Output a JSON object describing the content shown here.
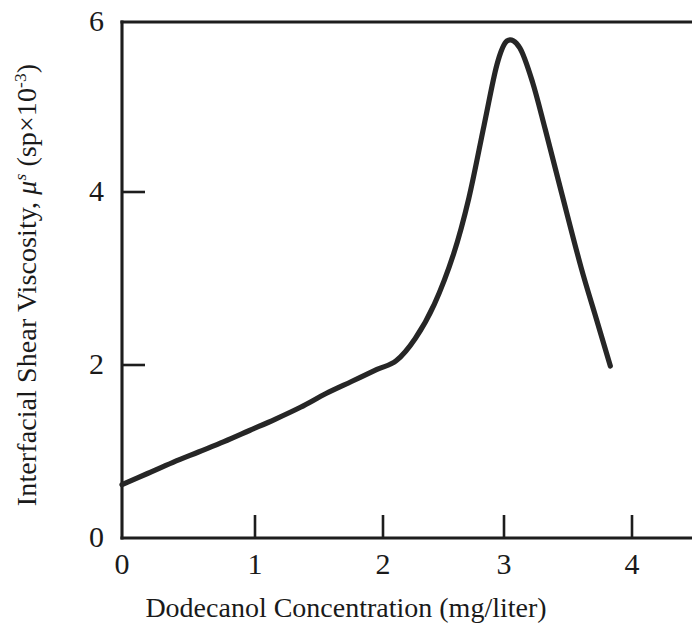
{
  "chart_data": {
    "type": "line",
    "title": "",
    "subtitle": "",
    "xlabel": "Dodecanol Concentration (mg/liter)",
    "ylabel_parts": {
      "prefix": "Interfacial Shear Viscosity, ",
      "symbol": "μ",
      "symbol_sup": "s",
      "unit_open": " (sp×10",
      "unit_exp": "-3",
      "unit_close": ")"
    },
    "ylabel_text": "Interfacial Shear Viscosity, μˢ (sp×10⁻³)",
    "xlim": [
      0,
      4.45
    ],
    "ylim": [
      0,
      6
    ],
    "xticks": [
      0,
      1,
      2,
      3,
      4
    ],
    "xtick_labels": [
      "0",
      "1",
      "2",
      "3",
      "4"
    ],
    "yticks": [
      0,
      2,
      4,
      6
    ],
    "ytick_labels": [
      "0",
      "2",
      "4",
      "6"
    ],
    "grid": false,
    "legend": null,
    "frame": "left-top-bottom",
    "line_color": "#262626",
    "axis_color": "#1d1d1d",
    "background": "#ffffff",
    "series": [
      {
        "name": "Interfacial shear viscosity vs dodecanol concentration",
        "x": [
          0.0,
          0.2,
          0.4,
          0.6,
          0.8,
          1.0,
          1.2,
          1.4,
          1.6,
          1.8,
          2.0,
          2.15,
          2.3,
          2.45,
          2.6,
          2.72,
          2.84,
          2.94,
          3.02,
          3.12,
          3.22,
          3.32,
          3.45,
          3.6,
          3.72,
          3.83
        ],
        "y": [
          0.62,
          0.75,
          0.88,
          1.0,
          1.12,
          1.25,
          1.38,
          1.52,
          1.68,
          1.82,
          1.96,
          2.06,
          2.32,
          2.72,
          3.3,
          3.95,
          4.8,
          5.5,
          5.78,
          5.7,
          5.3,
          4.75,
          4.0,
          3.15,
          2.55,
          2.0
        ]
      }
    ],
    "annotations": {
      "peak_x": 3.02,
      "peak_y": 5.78,
      "start_x": 0.0,
      "start_y": 0.62,
      "end_x": 3.83,
      "end_y": 2.0,
      "shoulder_x": 2.15,
      "shoulder_y": 2.06
    }
  }
}
